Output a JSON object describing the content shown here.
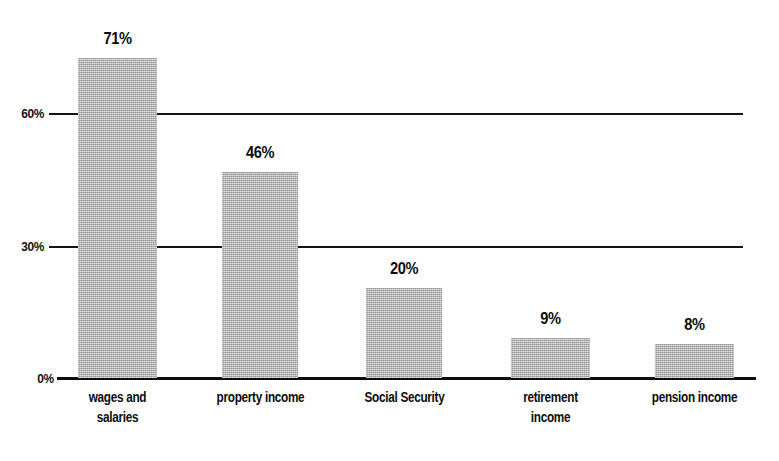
{
  "chart_data": {
    "type": "bar",
    "title": "",
    "subtitle": "",
    "xlabel": "",
    "ylabel": "",
    "categories": [
      "wages and\nsalaries",
      "property income",
      "Social Security",
      "retirement\nincome",
      "pension income"
    ],
    "values": [
      71,
      46,
      20,
      9,
      8
    ],
    "value_labels": [
      "71%",
      "46%",
      "20%",
      "9%",
      "8%"
    ],
    "ylim": [
      0,
      71
    ],
    "y_ticks": [
      0,
      30,
      60
    ],
    "y_tick_labels": [
      "0%",
      "30%",
      "60%"
    ],
    "grid": true,
    "gridlines_at": [
      30,
      60
    ],
    "legend": null,
    "legend_position": "none",
    "annotations": [],
    "series": [
      {
        "name": "share of households",
        "values": [
          71,
          46,
          20,
          9,
          8
        ]
      }
    ],
    "colors": {
      "bar_fill": "#b3b3b3",
      "axis_line": "#0d0d0d",
      "gridline": "#141414",
      "text": "#0b0b0b",
      "background": "#ffffff"
    }
  },
  "axis": {
    "y_labels": [
      {
        "text": "60%",
        "top_px": 104
      },
      {
        "text": "30%",
        "top_px": 237
      },
      {
        "text": "0%",
        "top_px": 369
      }
    ]
  },
  "bars": [
    {
      "label": "wages and\nsalaries",
      "value_label": "71%",
      "left_px": 78,
      "width_px": 79,
      "top_px": 58,
      "height_px": 320,
      "label_top_px": 30,
      "cat_top_px": 388,
      "cat_left_px": 58,
      "cat_width_px": 119
    },
    {
      "label": "property income",
      "value_label": "46%",
      "left_px": 222,
      "width_px": 76,
      "top_px": 172,
      "height_px": 206,
      "label_top_px": 144,
      "cat_top_px": 388,
      "cat_left_px": 200,
      "cat_width_px": 121
    },
    {
      "label": "Social Security",
      "value_label": "20%",
      "left_px": 366,
      "width_px": 76,
      "top_px": 288,
      "height_px": 90,
      "label_top_px": 260,
      "cat_top_px": 388,
      "cat_left_px": 344,
      "cat_width_px": 121
    },
    {
      "label": "retirement\nincome",
      "value_label": "9%",
      "left_px": 511,
      "width_px": 79,
      "top_px": 338,
      "height_px": 40,
      "label_top_px": 310,
      "cat_top_px": 388,
      "cat_left_px": 490,
      "cat_width_px": 121
    },
    {
      "label": "pension income",
      "value_label": "8%",
      "left_px": 655,
      "width_px": 79,
      "top_px": 344,
      "height_px": 34,
      "label_top_px": 316,
      "cat_top_px": 388,
      "cat_left_px": 634,
      "cat_width_px": 121
    }
  ]
}
